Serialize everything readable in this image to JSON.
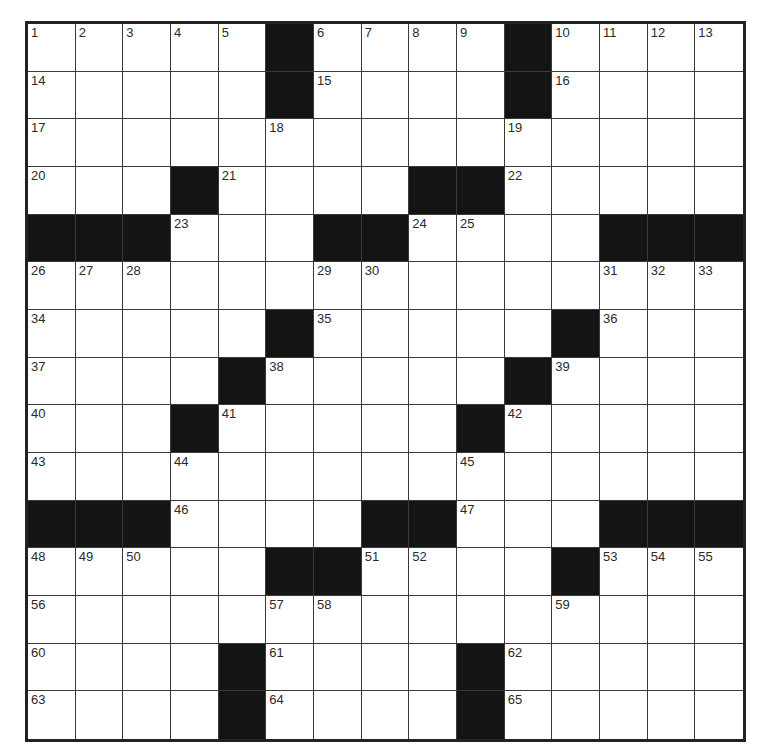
{
  "puzzle": {
    "size": 15,
    "colors": {
      "black_square": "#141414",
      "white_square": "#ffffff",
      "grid_line": "#3a3a3a",
      "border": "#222222"
    },
    "grid": [
      [
        "1",
        "2",
        "3",
        "4",
        "5",
        "#",
        "6",
        "7",
        "8",
        "9",
        "#",
        "10",
        "11",
        "12",
        "13"
      ],
      [
        "14",
        "",
        "",
        "",
        "",
        "#",
        "15",
        "",
        "",
        "",
        "#",
        "16",
        "",
        "",
        ""
      ],
      [
        "17",
        "",
        "",
        "",
        "",
        "18",
        "",
        "",
        "",
        "",
        "19",
        "",
        "",
        "",
        ""
      ],
      [
        "20",
        "",
        "",
        "#",
        "21",
        "",
        "",
        "",
        "#",
        "#",
        "22",
        "",
        "",
        "",
        ""
      ],
      [
        "#",
        "#",
        "#",
        "23",
        "",
        "",
        "#",
        "#",
        "24",
        "25",
        "",
        "",
        "#",
        "#",
        "#"
      ],
      [
        "26",
        "27",
        "28",
        "",
        "",
        "",
        "29",
        "30",
        "",
        "",
        "",
        "",
        "31",
        "32",
        "33"
      ],
      [
        "34",
        "",
        "",
        "",
        "",
        "#",
        "35",
        "",
        "",
        "",
        "",
        "#",
        "36",
        "",
        ""
      ],
      [
        "37",
        "",
        "",
        "",
        "#",
        "38",
        "",
        "",
        "",
        "",
        "#",
        "39",
        "",
        "",
        ""
      ],
      [
        "40",
        "",
        "",
        "#",
        "41",
        "",
        "",
        "",
        "",
        "#",
        "42",
        "",
        "",
        "",
        ""
      ],
      [
        "43",
        "",
        "",
        "44",
        "",
        "",
        "",
        "",
        "",
        "45",
        "",
        "",
        "",
        "",
        ""
      ],
      [
        "#",
        "#",
        "#",
        "46",
        "",
        "",
        "",
        "#",
        "#",
        "47",
        "",
        "",
        "#",
        "#",
        "#"
      ],
      [
        "48",
        "49",
        "50",
        "",
        "",
        "#",
        "#",
        "51",
        "52",
        "",
        "",
        "#",
        "53",
        "54",
        "55"
      ],
      [
        "56",
        "",
        "",
        "",
        "",
        "57",
        "58",
        "",
        "",
        "",
        "",
        "59",
        "",
        "",
        ""
      ],
      [
        "60",
        "",
        "",
        "",
        "#",
        "61",
        "",
        "",
        "",
        "#",
        "62",
        "",
        "",
        "",
        ""
      ],
      [
        "63",
        "",
        "",
        "",
        "#",
        "64",
        "",
        "",
        "",
        "#",
        "65",
        "",
        "",
        "",
        ""
      ]
    ]
  }
}
